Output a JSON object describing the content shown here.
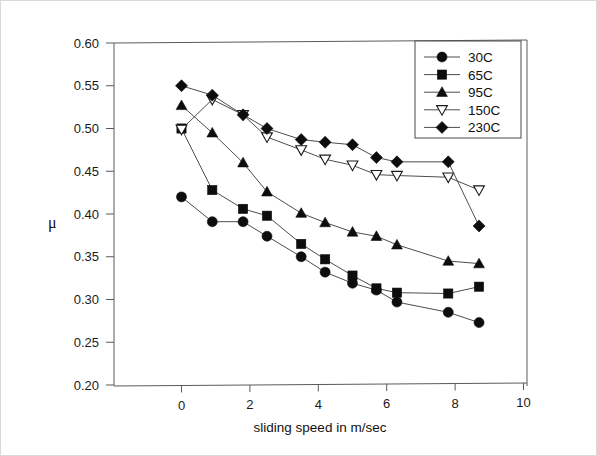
{
  "chart_data": {
    "type": "line",
    "title": "",
    "xlabel": "sliding speed in m/sec",
    "ylabel": "μ",
    "xlim": [
      -1.8,
      10.0
    ],
    "ylim": [
      0.2,
      0.6
    ],
    "xticks": [
      0,
      2,
      4,
      6,
      8,
      10
    ],
    "xtick_labels": [
      "0",
      "2",
      "4",
      "6",
      "8",
      "10"
    ],
    "yticks": [
      0.2,
      0.25,
      0.3,
      0.35,
      0.4,
      0.45,
      0.5,
      0.55,
      0.6
    ],
    "ytick_labels": [
      "0.20",
      "0.25",
      "0.30",
      "0.35",
      "0.40",
      "0.45",
      "0.50",
      "0.55",
      "0.60"
    ],
    "grid": false,
    "legend_position": "top-right",
    "series": [
      {
        "name": "30C",
        "marker": "filled-circle",
        "x": [
          0.0,
          0.9,
          1.8,
          2.5,
          3.5,
          4.2,
          5.0,
          5.7,
          6.3,
          7.8,
          8.7
        ],
        "values": [
          0.42,
          0.391,
          0.391,
          0.374,
          0.35,
          0.332,
          0.319,
          0.311,
          0.297,
          0.285,
          0.273
        ]
      },
      {
        "name": "65C",
        "marker": "filled-square",
        "x": [
          0.0,
          0.9,
          1.8,
          2.5,
          3.5,
          4.2,
          5.0,
          5.7,
          6.3,
          7.8,
          8.7
        ],
        "values": [
          0.5,
          0.428,
          0.406,
          0.398,
          0.365,
          0.347,
          0.328,
          0.313,
          0.308,
          0.307,
          0.315
        ]
      },
      {
        "name": "95C",
        "marker": "filled-triangle",
        "x": [
          0.0,
          0.9,
          1.8,
          2.5,
          3.5,
          4.2,
          5.0,
          5.7,
          6.3,
          7.8,
          8.7
        ],
        "values": [
          0.527,
          0.495,
          0.46,
          0.426,
          0.401,
          0.39,
          0.379,
          0.374,
          0.364,
          0.345,
          0.342
        ]
      },
      {
        "name": "150C",
        "marker": "open-triangle-down",
        "x": [
          0.0,
          0.9,
          1.8,
          2.5,
          3.5,
          4.2,
          5.0,
          5.7,
          6.3,
          7.8,
          8.7
        ],
        "values": [
          0.499,
          0.534,
          0.516,
          0.49,
          0.475,
          0.464,
          0.457,
          0.446,
          0.445,
          0.443,
          0.428
        ]
      },
      {
        "name": "230C",
        "marker": "filled-diamond",
        "x": [
          0.0,
          0.9,
          1.8,
          2.5,
          3.5,
          4.2,
          5.0,
          5.7,
          6.3,
          7.8,
          8.7
        ],
        "values": [
          0.55,
          0.539,
          0.516,
          0.5,
          0.487,
          0.484,
          0.481,
          0.466,
          0.461,
          0.461,
          0.386
        ]
      }
    ]
  },
  "legend": {
    "entries": [
      {
        "label": "30C"
      },
      {
        "label": "65C"
      },
      {
        "label": "95C"
      },
      {
        "label": "150C"
      },
      {
        "label": "230C"
      }
    ]
  },
  "axes": {
    "x_title": "sliding speed in m/sec",
    "y_title": "μ"
  },
  "colors": {
    "marker": "#0d0d0d",
    "line": "#4d4d4d",
    "axis": "#5a5a5a",
    "text": "#111111",
    "background": "#ffffff"
  }
}
